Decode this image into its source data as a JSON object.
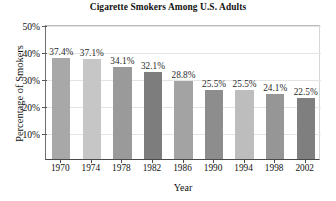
{
  "chart_data": {
    "type": "bar",
    "title": "Cigarette Smokers Among U.S. Adults",
    "xlabel": "Year",
    "ylabel": "Percentage of Smokers",
    "categories": [
      "1970",
      "1974",
      "1978",
      "1982",
      "1986",
      "1990",
      "1994",
      "1998",
      "2002"
    ],
    "values": [
      37.4,
      37.1,
      34.1,
      32.1,
      28.8,
      25.5,
      25.5,
      24.1,
      22.5
    ],
    "value_labels": [
      "37.4%",
      "37.1%",
      "34.1%",
      "32.1%",
      "28.8%",
      "25.5%",
      "25.5%",
      "24.1%",
      "22.5%"
    ],
    "bar_colors": [
      "#a8a8a8",
      "#c6c6c6",
      "#9a9a9a",
      "#7d7d7d",
      "#a3a3a3",
      "#8d8d8d",
      "#bdbdbd",
      "#969696",
      "#7f7f7f"
    ],
    "ylim": [
      0,
      50
    ],
    "ytick_labels": [
      "10%",
      "20%",
      "30%",
      "40%",
      "50%"
    ],
    "ytick_values": [
      10,
      20,
      30,
      40,
      50
    ],
    "grid": true,
    "legend": "none"
  }
}
